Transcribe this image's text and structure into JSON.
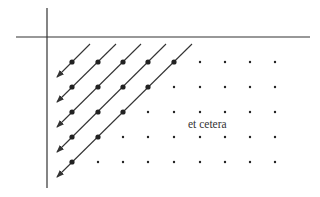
{
  "diagram": {
    "type": "diagonal-enumeration",
    "label": "et cetera",
    "grid": {
      "columns_x": [
        72,
        98,
        123,
        148,
        174,
        200,
        225,
        250,
        275
      ],
      "rows_y": [
        62,
        87,
        112,
        137,
        162
      ]
    },
    "axes": {
      "vertical": {
        "x": 47,
        "y1": 8,
        "y2": 188
      },
      "horizontal": {
        "y": 37,
        "x1": 16,
        "x2": 310
      }
    },
    "arrows_count": 5,
    "colors": {
      "line": "#333333",
      "dot": "#222222",
      "background": "#ffffff"
    }
  }
}
